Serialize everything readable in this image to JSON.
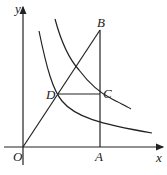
{
  "diagram": {
    "type": "coordinate-geometry",
    "labels": {
      "origin": "O",
      "x_axis": "x",
      "y_axis": "y",
      "A": "A",
      "B": "B",
      "C": "C",
      "D": "D"
    },
    "elements": [
      "x-axis",
      "y-axis",
      "segment OB",
      "segment AB (vertical)",
      "segment DC (horizontal)",
      "hyperbola through D (inner)",
      "hyperbola through C (outer)"
    ],
    "colors": {
      "stroke": "#222222",
      "background": "#ffffff"
    }
  }
}
